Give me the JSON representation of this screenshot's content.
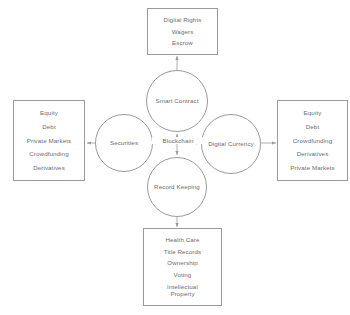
{
  "diagram": {
    "hub": {
      "label": "Blockchain"
    },
    "colors": {
      "stroke": "#9a9a9a",
      "text": "#6e6e6e",
      "background": "#ffffff"
    },
    "circles": {
      "smart_contract": "Smart Contract",
      "securities": "Securities",
      "digital_currency": "Digital Currency",
      "record_keeping": "Record Keeping"
    },
    "boxes": {
      "top": {
        "name": "smart-contract-applications",
        "items": [
          "Digital Rights",
          "Wagers",
          "Escrow"
        ]
      },
      "left": {
        "name": "securities-applications",
        "items": [
          "Equity",
          "Debt",
          "Private Markets",
          "Crowdfunding",
          "Derivatives"
        ]
      },
      "right": {
        "name": "digital-currency-applications",
        "items": [
          "Equity",
          "Debt",
          "Crowdfunding",
          "Derivatives",
          "Private Markets"
        ]
      },
      "bottom": {
        "name": "record-keeping-applications",
        "items": [
          "Health Care",
          "Title Records",
          "Ownership",
          "Voting",
          "Intellectual\nProperty"
        ]
      }
    }
  }
}
